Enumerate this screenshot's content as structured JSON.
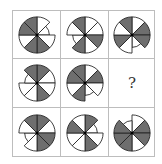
{
  "puzzle": {
    "colors": {
      "filled": "#6e6e6e",
      "empty": "#ffffff",
      "stroke": "#222222",
      "grid": "#bdbdbd"
    },
    "sector_order": "clockwise from 12 o'clock, 8 sectors of 45deg",
    "cells": [
      {
        "row": 0,
        "col": 0,
        "sectors": [
          "w",
          "s",
          "w",
          "g",
          "g",
          "w",
          "g",
          "g"
        ]
      },
      {
        "row": 0,
        "col": 1,
        "sectors": [
          "w",
          "w",
          "g",
          "w",
          "g",
          "s",
          "w",
          "g"
        ]
      },
      {
        "row": 0,
        "col": 2,
        "sectors": [
          "w",
          "g",
          "g",
          "s",
          "w",
          "g",
          "w",
          "g"
        ]
      },
      {
        "row": 1,
        "col": 0,
        "sectors": [
          "g",
          "w",
          "w",
          "g",
          "w",
          "w",
          "s",
          "g"
        ]
      },
      {
        "row": 1,
        "col": 1,
        "sectors": [
          "w",
          "g",
          "w",
          "s",
          "g",
          "w",
          "g",
          "g"
        ]
      },
      {
        "row": 1,
        "col": 2,
        "question": "?"
      },
      {
        "row": 2,
        "col": 0,
        "sectors": [
          "g",
          "w",
          "g",
          "g",
          "w",
          "s",
          "w",
          "g"
        ]
      },
      {
        "row": 2,
        "col": 1,
        "sectors": [
          "g",
          "s",
          "w",
          "g",
          "w",
          "w",
          "g",
          "w"
        ]
      },
      {
        "row": 2,
        "col": 2,
        "sectors": [
          "w",
          "g",
          "g",
          "w",
          "g",
          "g",
          "g",
          "s"
        ]
      }
    ]
  }
}
